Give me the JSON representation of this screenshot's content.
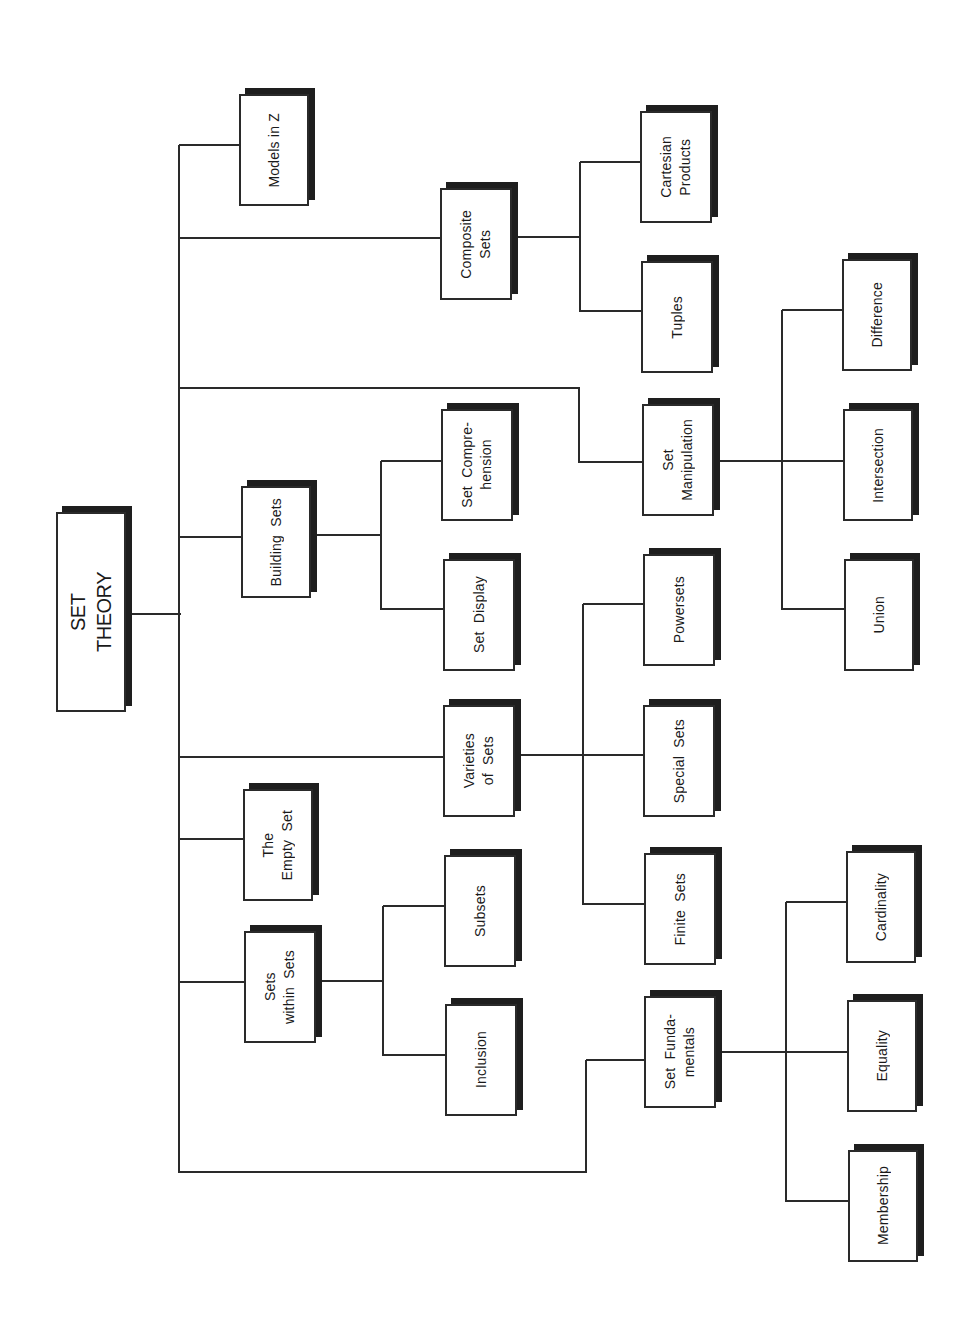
{
  "diagram": {
    "title": "SET THEORY",
    "colors": {
      "line": "#2a2a2a",
      "shadow": "#1e1e1e",
      "box_fill": "#ffffff",
      "text": "#1a1a1a"
    },
    "nodes": [
      {
        "id": "set-theory",
        "label": "SET\nTHEORY",
        "x": 56,
        "y": 512,
        "w": 70,
        "h": 200,
        "root": true
      },
      {
        "id": "models-in-z",
        "label": "Models in Z",
        "x": 239,
        "y": 94,
        "w": 70,
        "h": 112
      },
      {
        "id": "composite-sets",
        "label": "Composite\nSets",
        "x": 440,
        "y": 188,
        "w": 72,
        "h": 112
      },
      {
        "id": "cartesian-products",
        "label": "Cartesian\nProducts",
        "x": 640,
        "y": 111,
        "w": 72,
        "h": 112
      },
      {
        "id": "tuples",
        "label": "Tuples",
        "x": 641,
        "y": 261,
        "w": 72,
        "h": 112
      },
      {
        "id": "difference",
        "label": "Difference",
        "x": 842,
        "y": 259,
        "w": 70,
        "h": 112
      },
      {
        "id": "building-sets",
        "label": "Building  Sets",
        "x": 241,
        "y": 486,
        "w": 70,
        "h": 112
      },
      {
        "id": "set-comprehension",
        "label": "Set  Compre-\nhension",
        "x": 441,
        "y": 409,
        "w": 72,
        "h": 112
      },
      {
        "id": "set-display",
        "label": "Set  Display",
        "x": 443,
        "y": 559,
        "w": 72,
        "h": 112
      },
      {
        "id": "set-manipulation",
        "label": "Set\nManipulation",
        "x": 642,
        "y": 404,
        "w": 72,
        "h": 112
      },
      {
        "id": "intersection",
        "label": "Intersection",
        "x": 843,
        "y": 409,
        "w": 70,
        "h": 112
      },
      {
        "id": "union",
        "label": "Union",
        "x": 844,
        "y": 559,
        "w": 70,
        "h": 112
      },
      {
        "id": "powersets",
        "label": "Powersets",
        "x": 643,
        "y": 554,
        "w": 72,
        "h": 112
      },
      {
        "id": "varieties-of-sets",
        "label": "Varieties\nof  Sets",
        "x": 443,
        "y": 705,
        "w": 72,
        "h": 112
      },
      {
        "id": "special-sets",
        "label": "Special  Sets",
        "x": 643,
        "y": 705,
        "w": 72,
        "h": 112
      },
      {
        "id": "the-empty-set",
        "label": "The\nEmpty  Set",
        "x": 243,
        "y": 789,
        "w": 70,
        "h": 112
      },
      {
        "id": "subsets",
        "label": "Subsets",
        "x": 444,
        "y": 855,
        "w": 72,
        "h": 112
      },
      {
        "id": "finite-sets",
        "label": "Finite  Sets",
        "x": 644,
        "y": 853,
        "w": 72,
        "h": 112
      },
      {
        "id": "cardinality",
        "label": "Cardinality",
        "x": 846,
        "y": 851,
        "w": 70,
        "h": 112
      },
      {
        "id": "sets-within-sets",
        "label": "Sets\nwithin  Sets",
        "x": 244,
        "y": 931,
        "w": 72,
        "h": 112
      },
      {
        "id": "inclusion",
        "label": "Inclusion",
        "x": 445,
        "y": 1004,
        "w": 72,
        "h": 112
      },
      {
        "id": "set-fundamentals",
        "label": "Set  Funda-\nmentals",
        "x": 644,
        "y": 996,
        "w": 72,
        "h": 112
      },
      {
        "id": "equality",
        "label": "Equality",
        "x": 847,
        "y": 1000,
        "w": 70,
        "h": 112
      },
      {
        "id": "membership",
        "label": "Membership",
        "x": 848,
        "y": 1150,
        "w": 70,
        "h": 112
      }
    ],
    "edges": [
      {
        "from": "set-theory",
        "to": "models-in-z"
      },
      {
        "from": "set-theory",
        "to": "composite-sets"
      },
      {
        "from": "set-theory",
        "to": "set-manipulation"
      },
      {
        "from": "set-theory",
        "to": "building-sets"
      },
      {
        "from": "set-theory",
        "to": "varieties-of-sets"
      },
      {
        "from": "set-theory",
        "to": "the-empty-set"
      },
      {
        "from": "set-theory",
        "to": "sets-within-sets"
      },
      {
        "from": "set-theory",
        "to": "set-fundamentals"
      },
      {
        "from": "composite-sets",
        "to": "cartesian-products"
      },
      {
        "from": "composite-sets",
        "to": "tuples"
      },
      {
        "from": "building-sets",
        "to": "set-comprehension"
      },
      {
        "from": "building-sets",
        "to": "set-display"
      },
      {
        "from": "set-manipulation",
        "to": "difference"
      },
      {
        "from": "set-manipulation",
        "to": "intersection"
      },
      {
        "from": "set-manipulation",
        "to": "union"
      },
      {
        "from": "varieties-of-sets",
        "to": "powersets"
      },
      {
        "from": "varieties-of-sets",
        "to": "special-sets"
      },
      {
        "from": "varieties-of-sets",
        "to": "finite-sets"
      },
      {
        "from": "sets-within-sets",
        "to": "subsets"
      },
      {
        "from": "sets-within-sets",
        "to": "inclusion"
      },
      {
        "from": "set-fundamentals",
        "to": "cardinality"
      },
      {
        "from": "set-fundamentals",
        "to": "equality"
      },
      {
        "from": "set-fundamentals",
        "to": "membership"
      }
    ],
    "segments": [
      {
        "x1": 126,
        "y1": 614,
        "x2": 181,
        "y2": 614
      },
      {
        "x1": 179,
        "y1": 145,
        "x2": 179,
        "y2": 1173
      },
      {
        "x1": 179,
        "y1": 145,
        "x2": 239,
        "y2": 145
      },
      {
        "x1": 179,
        "y1": 238,
        "x2": 440,
        "y2": 238
      },
      {
        "x1": 179,
        "y1": 388,
        "x2": 580,
        "y2": 388
      },
      {
        "x1": 579,
        "y1": 388,
        "x2": 579,
        "y2": 463
      },
      {
        "x1": 579,
        "y1": 462,
        "x2": 642,
        "y2": 462
      },
      {
        "x1": 179,
        "y1": 537,
        "x2": 241,
        "y2": 537
      },
      {
        "x1": 179,
        "y1": 757,
        "x2": 443,
        "y2": 757
      },
      {
        "x1": 179,
        "y1": 839,
        "x2": 243,
        "y2": 839
      },
      {
        "x1": 179,
        "y1": 982,
        "x2": 244,
        "y2": 982
      },
      {
        "x1": 179,
        "y1": 1172,
        "x2": 587,
        "y2": 1172
      },
      {
        "x1": 586,
        "y1": 1060,
        "x2": 586,
        "y2": 1173
      },
      {
        "x1": 586,
        "y1": 1060,
        "x2": 644,
        "y2": 1060
      },
      {
        "x1": 512,
        "y1": 237,
        "x2": 581,
        "y2": 237
      },
      {
        "x1": 580,
        "y1": 162,
        "x2": 580,
        "y2": 312
      },
      {
        "x1": 580,
        "y1": 162,
        "x2": 640,
        "y2": 162
      },
      {
        "x1": 580,
        "y1": 311,
        "x2": 641,
        "y2": 311
      },
      {
        "x1": 311,
        "y1": 535,
        "x2": 382,
        "y2": 535
      },
      {
        "x1": 381,
        "y1": 461,
        "x2": 381,
        "y2": 610
      },
      {
        "x1": 381,
        "y1": 461,
        "x2": 441,
        "y2": 461
      },
      {
        "x1": 381,
        "y1": 609,
        "x2": 443,
        "y2": 609
      },
      {
        "x1": 714,
        "y1": 461,
        "x2": 843,
        "y2": 461
      },
      {
        "x1": 782,
        "y1": 310,
        "x2": 782,
        "y2": 610
      },
      {
        "x1": 782,
        "y1": 310,
        "x2": 842,
        "y2": 310
      },
      {
        "x1": 782,
        "y1": 609,
        "x2": 844,
        "y2": 609
      },
      {
        "x1": 515,
        "y1": 755,
        "x2": 643,
        "y2": 755
      },
      {
        "x1": 583,
        "y1": 604,
        "x2": 583,
        "y2": 905
      },
      {
        "x1": 583,
        "y1": 604,
        "x2": 643,
        "y2": 604
      },
      {
        "x1": 583,
        "y1": 904,
        "x2": 644,
        "y2": 904
      },
      {
        "x1": 316,
        "y1": 981,
        "x2": 384,
        "y2": 981
      },
      {
        "x1": 383,
        "y1": 906,
        "x2": 383,
        "y2": 1056
      },
      {
        "x1": 383,
        "y1": 906,
        "x2": 444,
        "y2": 906
      },
      {
        "x1": 383,
        "y1": 1055,
        "x2": 445,
        "y2": 1055
      },
      {
        "x1": 716,
        "y1": 1052,
        "x2": 847,
        "y2": 1052
      },
      {
        "x1": 786,
        "y1": 902,
        "x2": 786,
        "y2": 1202
      },
      {
        "x1": 786,
        "y1": 902,
        "x2": 846,
        "y2": 902
      },
      {
        "x1": 786,
        "y1": 1201,
        "x2": 848,
        "y2": 1201
      }
    ]
  }
}
